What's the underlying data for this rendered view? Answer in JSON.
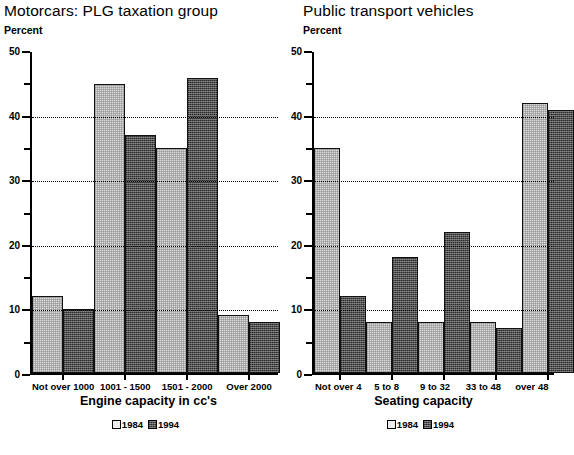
{
  "charts": [
    {
      "title": "Motorcars: PLG taxation group",
      "ylabel": "Percent",
      "xlabel": "Engine capacity in cc's",
      "legend": [
        {
          "label": "1984",
          "swatch": "light-checkered-swatch"
        },
        {
          "label": "1994",
          "swatch": "dark-checkered-swatch"
        }
      ]
    },
    {
      "title": "Public transport vehicles",
      "ylabel": "Percent",
      "xlabel": "Seating capacity",
      "legend": [
        {
          "label": "1984",
          "swatch": "light-checkered-swatch"
        },
        {
          "label": "1994",
          "swatch": "dark-checkered-swatch"
        }
      ]
    }
  ],
  "chart_data": [
    {
      "type": "bar",
      "title": "Motorcars: PLG taxation group",
      "xlabel": "Engine capacity in cc's",
      "ylabel": "Percent",
      "categories": [
        "Not over 1000",
        "1001 - 1500",
        "1501 - 2000",
        "Over 2000"
      ],
      "series": [
        {
          "name": "1984",
          "values": [
            12,
            45,
            35,
            9
          ]
        },
        {
          "name": "1994",
          "values": [
            10,
            37,
            46,
            8
          ]
        }
      ],
      "ylim": [
        0,
        50
      ],
      "yticks": [
        0,
        10,
        20,
        30,
        40,
        50
      ],
      "yticks_minor": [
        5,
        15,
        25,
        35,
        45
      ],
      "gridlines": [
        10,
        20,
        30,
        40
      ],
      "grid": "horizontal-dotted",
      "legend_position": "bottom-center"
    },
    {
      "type": "bar",
      "title": "Public transport vehicles",
      "xlabel": "Seating capacity",
      "ylabel": "Percent",
      "categories": [
        "Not over 4",
        "5 to 8",
        "9 to 32",
        "33 to 48",
        "over 48"
      ],
      "series": [
        {
          "name": "1984",
          "values": [
            35,
            8,
            8,
            8,
            42
          ]
        },
        {
          "name": "1994",
          "values": [
            12,
            18,
            22,
            7,
            41
          ]
        }
      ],
      "ylim": [
        0,
        50
      ],
      "yticks": [
        0,
        10,
        20,
        30,
        40,
        50
      ],
      "yticks_minor": [
        5,
        15,
        25,
        35,
        45
      ],
      "gridlines": [
        10,
        20,
        30,
        40
      ],
      "grid": "horizontal-dotted",
      "legend_position": "bottom-center"
    }
  ]
}
